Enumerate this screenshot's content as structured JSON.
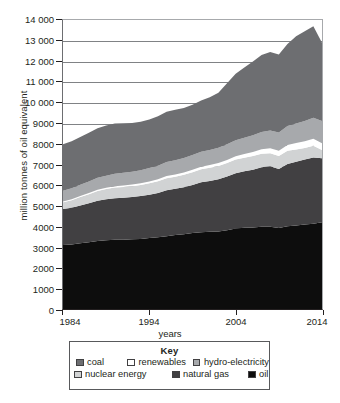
{
  "chart": {
    "y_axis_title": "million tonnes of oil equivalent",
    "x_axis_title": "years"
  },
  "legend": {
    "title": "Key",
    "row1": [
      {
        "label": "coal",
        "color": "#6d6e71",
        "swatch": "swatch-coal"
      },
      {
        "label": "renewables",
        "color": "#ffffff",
        "swatch": "swatch-renewables"
      },
      {
        "label": "hydro-electricity",
        "color": "#a7a9ac",
        "swatch": "swatch-hydro-electricity"
      }
    ],
    "row2": [
      {
        "label": "nuclear energy",
        "color": "#d1d3d4",
        "swatch": "swatch-nuclear-energy"
      },
      {
        "label": "natural gas",
        "color": "#414042",
        "swatch": "swatch-natural-gas"
      },
      {
        "label": "oil",
        "color": "#0d0d0d",
        "swatch": "swatch-oil"
      }
    ]
  },
  "chart_data": {
    "type": "area",
    "stacked": true,
    "title": "",
    "xlabel": "years",
    "ylabel": "million tonnes of oil equivalent",
    "xlim": [
      1984,
      2014
    ],
    "ylim": [
      0,
      14000
    ],
    "ytick_labels": [
      "0",
      "1000",
      "2000",
      "3000",
      "4000",
      "5000",
      "6000",
      "7000",
      "8000",
      "9000",
      "10 000",
      "11 000",
      "12 000",
      "13 000",
      "14 000"
    ],
    "ytick_values": [
      0,
      1000,
      2000,
      3000,
      4000,
      5000,
      6000,
      7000,
      8000,
      9000,
      10000,
      11000,
      12000,
      13000,
      14000
    ],
    "xtick_labels": [
      "1984",
      "1994",
      "2004",
      "2014"
    ],
    "xtick_values": [
      1984,
      1994,
      2004,
      2014
    ],
    "grid": true,
    "grid_axis": "y",
    "legend_position": "bottom",
    "legend_title": "Key",
    "x": [
      1984,
      1985,
      1986,
      1987,
      1988,
      1989,
      1990,
      1991,
      1992,
      1993,
      1994,
      1995,
      1996,
      1997,
      1998,
      1999,
      2000,
      2001,
      2002,
      2003,
      2004,
      2005,
      2006,
      2007,
      2008,
      2009,
      2010,
      2011,
      2012,
      2013,
      2014
    ],
    "stack_order_bottom_to_top": [
      "oil",
      "natural gas",
      "nuclear energy",
      "renewables",
      "hydro-electricity",
      "coal"
    ],
    "series": [
      {
        "name": "oil",
        "color": "#0d0d0d",
        "values": [
          3100,
          3120,
          3180,
          3230,
          3290,
          3330,
          3360,
          3360,
          3380,
          3390,
          3440,
          3480,
          3530,
          3590,
          3620,
          3680,
          3720,
          3740,
          3760,
          3820,
          3900,
          3930,
          3950,
          3980,
          3980,
          3920,
          4010,
          4050,
          4090,
          4130,
          4200
        ]
      },
      {
        "name": "natural gas",
        "color": "#414042",
        "values": [
          1750,
          1780,
          1830,
          1890,
          1950,
          1990,
          2010,
          2030,
          2050,
          2080,
          2100,
          2140,
          2220,
          2230,
          2280,
          2330,
          2420,
          2460,
          2520,
          2600,
          2680,
          2740,
          2800,
          2890,
          2930,
          2860,
          3010,
          3080,
          3150,
          3210,
          3100
        ]
      },
      {
        "name": "nuclear energy",
        "color": "#d1d3d4",
        "values": [
          320,
          370,
          410,
          440,
          480,
          490,
          510,
          520,
          520,
          540,
          550,
          570,
          590,
          590,
          600,
          620,
          630,
          640,
          650,
          650,
          660,
          660,
          660,
          650,
          640,
          630,
          640,
          600,
          560,
          570,
          400
        ]
      },
      {
        "name": "renewables",
        "color": "#ffffff",
        "values": [
          40,
          45,
          50,
          55,
          60,
          65,
          70,
          75,
          80,
          85,
          90,
          95,
          100,
          105,
          110,
          115,
          120,
          130,
          140,
          150,
          165,
          180,
          200,
          220,
          240,
          260,
          290,
          310,
          330,
          340,
          330
        ]
      },
      {
        "name": "hydro-electricity",
        "color": "#a7a9ac",
        "values": [
          520,
          530,
          545,
          560,
          575,
          585,
          600,
          610,
          615,
          630,
          645,
          660,
          680,
          690,
          700,
          710,
          725,
          730,
          740,
          755,
          775,
          790,
          810,
          830,
          860,
          880,
          910,
          940,
          980,
          1010,
          1080
        ]
      },
      {
        "name": "coal",
        "color": "#6d6e71",
        "values": [
          2250,
          2280,
          2320,
          2360,
          2400,
          2430,
          2430,
          2400,
          2360,
          2350,
          2350,
          2390,
          2430,
          2450,
          2430,
          2440,
          2490,
          2560,
          2660,
          2960,
          3220,
          3400,
          3570,
          3740,
          3800,
          3780,
          3980,
          4230,
          4350,
          4440,
          3790
        ]
      }
    ],
    "totals": [
      7980,
      8125,
      8335,
      8535,
      8755,
      8890,
      8980,
      8995,
      8965,
      9075,
      9175,
      9335,
      9550,
      9655,
      9740,
      9895,
      10105,
      10260,
      10470,
      10935,
      11400,
      11700,
      11990,
      12310,
      12450,
      12330,
      12840,
      13210,
      13460,
      13700,
      12900
    ]
  }
}
